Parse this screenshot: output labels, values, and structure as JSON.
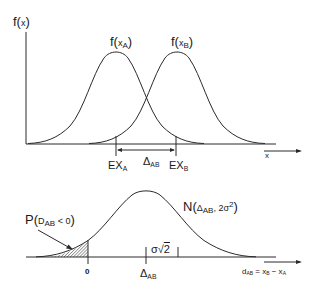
{
  "top_panel": {
    "y_axis_label": {
      "prefix": "f(",
      "var": "x",
      "suffix": ")"
    },
    "curve_a_label": {
      "prefix": "f(",
      "var": "x",
      "sub": "A",
      "suffix": ")"
    },
    "curve_b_label": {
      "prefix": "f(",
      "var": "x",
      "sub": "B",
      "suffix": ")"
    },
    "marker_a": {
      "main": "EX",
      "sub": "A"
    },
    "marker_b": {
      "main": "EX",
      "sub": "B"
    },
    "delta_label": {
      "main": "Δ",
      "sub": "AB"
    },
    "x_axis_label": "x"
  },
  "bottom_panel": {
    "distribution_label": {
      "prefix": "N(",
      "delta": "Δ",
      "delta_sub": "AB",
      "sep": ", 2σ",
      "sup": "2",
      "suffix": ")"
    },
    "probability_label": {
      "prefix": "P(",
      "var": "D",
      "sub": "AB",
      "cmp": " < 0",
      "suffix": ")"
    },
    "zero_tick_label": "0",
    "delta_tick_label": {
      "main": "Δ",
      "sub": "AB"
    },
    "sigma_label": {
      "sigma": "σ",
      "root": "√",
      "radicand": "2"
    },
    "x_axis_label": {
      "main": "d",
      "sub": "AB",
      "eq": " = x",
      "b_sub": "B",
      "minus": " − x",
      "a_sub": "A"
    }
  },
  "colors": {
    "line": "#2a2a2a",
    "background": "#ffffff",
    "hatch": "#444444"
  }
}
